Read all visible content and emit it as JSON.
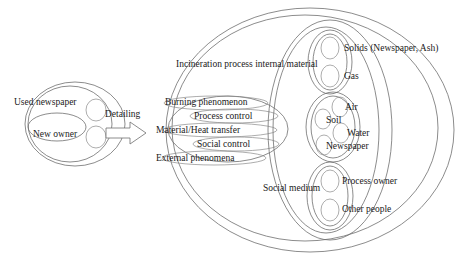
{
  "diagram": {
    "title_text_color": "#1a1a1a",
    "stroke_color": "#6e6e6e",
    "background": "#ffffff",
    "transition": {
      "label": "Detailing",
      "arrow": "right-block-arrow"
    },
    "left_group": {
      "name": "used-newspaper-system",
      "outer_label": "Used newspaper",
      "inner_label": "New owner"
    },
    "right_group": {
      "name": "incineration-system",
      "internal_material_label": "Incineration process internal material",
      "social_medium_label": "Social medium",
      "phenomena": [
        "Burning phenomenon",
        "Process control",
        "Material/Heat transfer",
        "Social control",
        "External phenomena"
      ],
      "material_states": [
        "Solids (Newspaper, Ash)",
        "Gas"
      ],
      "environment": [
        "Air",
        "Soil",
        "Water",
        "Newspaper"
      ],
      "actors": [
        "Process owner",
        "Other people"
      ]
    }
  }
}
